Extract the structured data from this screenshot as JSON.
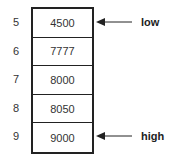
{
  "diagram": {
    "indices": [
      "5",
      "6",
      "7",
      "8",
      "9"
    ],
    "values": [
      "4500",
      "7777",
      "8000",
      "8050",
      "9000"
    ],
    "pointers": [
      {
        "label": "low",
        "row": 0
      },
      {
        "label": "high",
        "row": 4
      }
    ]
  }
}
